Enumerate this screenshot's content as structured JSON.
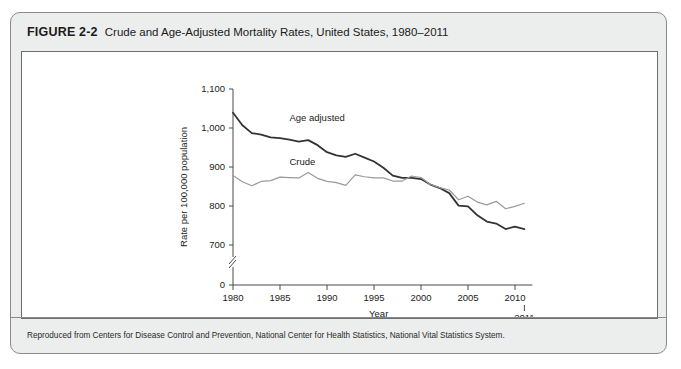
{
  "figure": {
    "number": "FIGURE 2-2",
    "title": "Crude and Age-Adjusted Mortality Rates, United States, 1980–2011",
    "source": "Reproduced from Centers for Disease Control and Prevention, National Center for Health Statistics, National Vital Statistics System."
  },
  "chart_data": {
    "type": "line",
    "title": "Crude and Age-Adjusted Mortality Rates, United States, 1980–2011",
    "xlabel": "Year",
    "ylabel": "Rate per 100,000 population",
    "xlim": [
      1979,
      2012
    ],
    "ylim": [
      650,
      1100
    ],
    "grid": false,
    "legend": "inline-labels",
    "y_axis_break": true,
    "y_ticks": [
      "0",
      "700",
      "800",
      "900",
      "1,000",
      "1,100"
    ],
    "y_tick_values": [
      0,
      700,
      800,
      900,
      1000,
      1100
    ],
    "x_ticks": [
      "1980",
      "1985",
      "1990",
      "1995",
      "2000",
      "2005",
      "2010"
    ],
    "x_tick_values": [
      1980,
      1985,
      1990,
      1995,
      2000,
      2005,
      2010
    ],
    "x_extra_tick": {
      "label": "2011",
      "value": 2011
    },
    "x": [
      1980,
      1981,
      1982,
      1983,
      1984,
      1985,
      1986,
      1987,
      1988,
      1989,
      1990,
      1991,
      1992,
      1993,
      1994,
      1995,
      1996,
      1997,
      1998,
      1999,
      2000,
      2001,
      2002,
      2003,
      2004,
      2005,
      2006,
      2007,
      2008,
      2009,
      2010,
      2011
    ],
    "series": [
      {
        "name": "Age adjusted",
        "color": "#333333",
        "width": 1.8,
        "label_x": 1986,
        "label_y": 1018,
        "values": [
          1039,
          1007,
          987,
          983,
          976,
          974,
          970,
          965,
          969,
          956,
          938,
          930,
          926,
          934,
          924,
          914,
          898,
          878,
          872,
          872,
          869,
          855,
          846,
          833,
          801,
          799,
          776,
          760,
          755,
          741,
          747,
          741
        ]
      },
      {
        "name": "Crude",
        "color": "#9a9a9a",
        "width": 1.2,
        "label_x": 1986,
        "label_y": 905,
        "values": [
          878,
          862,
          852,
          863,
          865,
          874,
          873,
          872,
          886,
          871,
          863,
          860,
          853,
          880,
          875,
          872,
          872,
          864,
          864,
          877,
          873,
          855,
          847,
          841,
          816,
          825,
          810,
          803,
          812,
          793,
          799,
          807
        ]
      }
    ]
  }
}
